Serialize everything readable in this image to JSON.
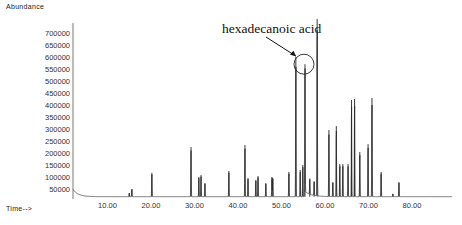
{
  "chart_data": {
    "type": "line",
    "subtype": "chromatogram",
    "title": "",
    "ylabel": "Abundance",
    "xlabel": "Time-->",
    "xlim": [
      2,
      88
    ],
    "ylim": [
      0,
      725000
    ],
    "grid": false,
    "legend": null,
    "y_ticks": [
      50000,
      100000,
      150000,
      200000,
      250000,
      300000,
      350000,
      400000,
      450000,
      500000,
      550000,
      600000,
      650000,
      700000
    ],
    "y_tick_labels": [
      "50000",
      "100000",
      "150000",
      "200000",
      "250000",
      "300000",
      "350000",
      "400000",
      "450000",
      "500000",
      "550000",
      "600000",
      "650000",
      "700000"
    ],
    "x_ticks": [
      10,
      20,
      30,
      40,
      50,
      60,
      70,
      80
    ],
    "x_tick_labels": [
      "10.00",
      "20.00",
      "30.00",
      "40.00",
      "50.00",
      "60.00",
      "70.00",
      "80.00"
    ],
    "baseline": 18000,
    "peaks": [
      {
        "t": 15.0,
        "abundance": 33000
      },
      {
        "t": 15.6,
        "abundance": 50000
      },
      {
        "t": 20.2,
        "abundance": 117000
      },
      {
        "t": 29.2,
        "abundance": 225000
      },
      {
        "t": 31.0,
        "abundance": 100000
      },
      {
        "t": 31.5,
        "abundance": 108000
      },
      {
        "t": 32.4,
        "abundance": 75000
      },
      {
        "t": 37.9,
        "abundance": 125000
      },
      {
        "t": 41.6,
        "abundance": 233000
      },
      {
        "t": 42.3,
        "abundance": 96000
      },
      {
        "t": 44.1,
        "abundance": 88000
      },
      {
        "t": 44.6,
        "abundance": 104000
      },
      {
        "t": 46.4,
        "abundance": 75000
      },
      {
        "t": 47.8,
        "abundance": 100000
      },
      {
        "t": 48.0,
        "abundance": 96000
      },
      {
        "t": 51.7,
        "abundance": 121000
      },
      {
        "t": 53.3,
        "abundance": 600000
      },
      {
        "t": 54.3,
        "abundance": 129000
      },
      {
        "t": 54.9,
        "abundance": 150000
      },
      {
        "t": 55.4,
        "abundance": 570000
      },
      {
        "t": 56.5,
        "abundance": 88000
      },
      {
        "t": 57.5,
        "abundance": 80000
      },
      {
        "t": 58.2,
        "abundance": 760000
      },
      {
        "t": 60.9,
        "abundance": 296000
      },
      {
        "t": 61.8,
        "abundance": 79000
      },
      {
        "t": 62.6,
        "abundance": 312000
      },
      {
        "t": 63.4,
        "abundance": 154000
      },
      {
        "t": 64.1,
        "abundance": 154000
      },
      {
        "t": 65.3,
        "abundance": 154000
      },
      {
        "t": 66.1,
        "abundance": 421000
      },
      {
        "t": 66.8,
        "abundance": 425000
      },
      {
        "t": 68.0,
        "abundance": 204000
      },
      {
        "t": 69.9,
        "abundance": 237000
      },
      {
        "t": 70.8,
        "abundance": 429000
      },
      {
        "t": 72.9,
        "abundance": 121000
      },
      {
        "t": 75.6,
        "abundance": 30000
      },
      {
        "t": 77.0,
        "abundance": 79000
      }
    ],
    "annotations": [
      {
        "text": "hexadecanoic acid",
        "target_t": 55.4,
        "target_abundance": 570000,
        "marker": "circle",
        "arrow": true
      }
    ]
  },
  "labels": {
    "y_axis": "Abundance",
    "x_axis": "Time-->",
    "annotation": "hexadecanoic acid"
  }
}
